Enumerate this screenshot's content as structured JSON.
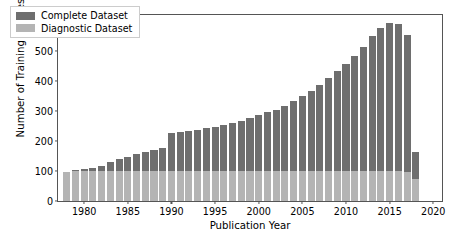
{
  "chart_data": {
    "type": "bar",
    "barmode": "stacked",
    "title": "",
    "xlabel": "Publication Year",
    "ylabel": "Number of Training Articles (k)",
    "xlim": [
      1977.0,
      2021.0
    ],
    "ylim": [
      0,
      620
    ],
    "grid": false,
    "legend_position": "top-left",
    "xticks": [
      1980,
      1985,
      1990,
      1995,
      2000,
      2005,
      2010,
      2015,
      2020
    ],
    "yticks": [
      0,
      100,
      200,
      300,
      400,
      500,
      600
    ],
    "categories": [
      1978,
      1979,
      1980,
      1981,
      1982,
      1983,
      1984,
      1985,
      1986,
      1987,
      1988,
      1989,
      1990,
      1991,
      1992,
      1993,
      1994,
      1995,
      1996,
      1997,
      1998,
      1999,
      2000,
      2001,
      2002,
      2003,
      2004,
      2005,
      2006,
      2007,
      2008,
      2009,
      2010,
      2011,
      2012,
      2013,
      2014,
      2015,
      2016,
      2017,
      2018
    ],
    "series": [
      {
        "name": "Diagnostic Dataset",
        "color": "#b4b4b4",
        "values": [
          97,
          100,
          100,
          100,
          100,
          100,
          100,
          100,
          100,
          100,
          100,
          100,
          100,
          100,
          100,
          100,
          100,
          100,
          100,
          100,
          100,
          100,
          100,
          100,
          100,
          100,
          100,
          100,
          100,
          100,
          100,
          100,
          100,
          100,
          100,
          100,
          100,
          100,
          100,
          98,
          75
        ]
      },
      {
        "name": "Complete Dataset",
        "color": "#6e6e6e",
        "values": [
          0,
          5,
          8,
          10,
          18,
          30,
          40,
          48,
          58,
          65,
          70,
          78,
          128,
          130,
          133,
          138,
          142,
          148,
          155,
          160,
          168,
          178,
          188,
          197,
          205,
          218,
          232,
          250,
          268,
          288,
          310,
          332,
          358,
          385,
          415,
          450,
          478,
          495,
          490,
          455,
          90
        ]
      }
    ],
    "totals": [
      97,
      105,
      108,
      110,
      118,
      130,
      140,
      148,
      158,
      165,
      170,
      178,
      228,
      230,
      233,
      238,
      242,
      248,
      255,
      260,
      268,
      278,
      288,
      297,
      305,
      318,
      332,
      350,
      368,
      388,
      410,
      432,
      458,
      485,
      515,
      550,
      578,
      595,
      590,
      553,
      165
    ]
  },
  "legend": {
    "items": [
      {
        "label": "Complete Dataset",
        "color": "#6e6e6e"
      },
      {
        "label": "Diagnostic Dataset",
        "color": "#b4b4b4"
      }
    ]
  },
  "axes": {
    "xlabel": "Publication Year",
    "ylabel": "Number of Training Articles (k)"
  }
}
